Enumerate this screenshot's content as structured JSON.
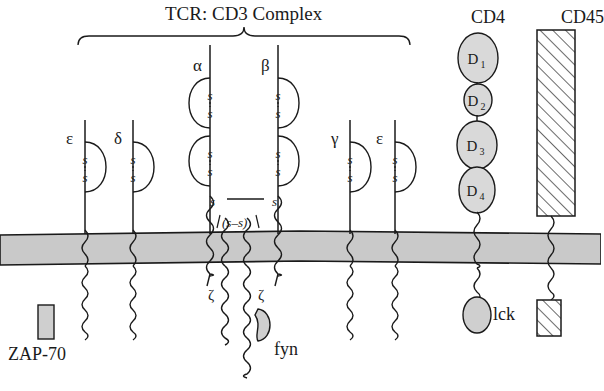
{
  "diagram": {
    "title": "TCR: CD3 Complex",
    "bracket": {
      "x1": 78,
      "x2": 410,
      "y": 36
    },
    "membrane": {
      "color": "#c9c9c9",
      "top": 232,
      "bottom": 262
    }
  },
  "complex_chains": [
    {
      "name": "epsilon",
      "label": "ε",
      "x": 85,
      "label_x": 66,
      "label_y": 130,
      "stem_top": 120,
      "loops": 1,
      "loop_side": "right",
      "ss_labels": [
        "s",
        "s"
      ]
    },
    {
      "name": "delta",
      "label": "δ",
      "x": 133,
      "label_x": 114,
      "label_y": 130,
      "stem_top": 120,
      "loops": 1,
      "loop_side": "right",
      "ss_labels": [
        "s",
        "s"
      ]
    },
    {
      "name": "alpha",
      "label": "α",
      "x": 210,
      "label_x": 193,
      "label_y": 57,
      "stem_top": 45,
      "loops": 2,
      "loop_side": "left",
      "ss_labels": [
        "s",
        "s"
      ]
    },
    {
      "name": "beta",
      "label": "β",
      "x": 278,
      "label_x": 261,
      "label_y": 57,
      "stem_top": 45,
      "loops": 2,
      "loop_side": "right",
      "ss_labels": [
        "s",
        "s"
      ]
    },
    {
      "name": "gamma",
      "label": "γ",
      "x": 350,
      "label_x": 331,
      "label_y": 130,
      "stem_top": 120,
      "loops": 1,
      "loop_side": "right",
      "ss_labels": [
        "s",
        "s"
      ]
    },
    {
      "name": "epsilon-2",
      "label": "ε",
      "x": 395,
      "label_x": 376,
      "label_y": 130,
      "stem_top": 120,
      "loops": 1,
      "loop_side": "right",
      "ss_labels": [
        "s",
        "s"
      ]
    }
  ],
  "bonds": {
    "alpha_beta": {
      "left_label": "s",
      "right_label": "s",
      "y": 203,
      "x1": 219,
      "x2": 270
    },
    "zeta_zeta": {
      "label": "(s–s)",
      "x": 238,
      "y": 224
    }
  },
  "zeta_chains": [
    {
      "label": "ζ",
      "label_x": 208,
      "label_y": 288,
      "x": 225
    },
    {
      "label": "ζ",
      "label_x": 258,
      "label_y": 288,
      "x": 247
    }
  ],
  "cd4": {
    "label": "CD4",
    "label_x": 471,
    "label_y": 8,
    "domains": [
      {
        "label": "D",
        "sub": "1",
        "cx": 478,
        "cy": 58,
        "rx": 20,
        "ry": 25
      },
      {
        "label": "D",
        "sub": "2",
        "cx": 478,
        "cy": 100,
        "rx": 14,
        "ry": 16
      },
      {
        "label": "D",
        "sub": "3",
        "cx": 477,
        "cy": 145,
        "rx": 20,
        "ry": 24
      },
      {
        "label": "D",
        "sub": "4",
        "cx": 477,
        "cy": 190,
        "rx": 18,
        "ry": 23
      }
    ],
    "fill": "#d9d9d9",
    "chain_x": 477
  },
  "cd45": {
    "label": "CD45",
    "label_x": 561,
    "label_y": 8,
    "ecto_box": {
      "x": 537,
      "y": 30,
      "w": 38,
      "h": 186
    },
    "cyto_box": {
      "x": 537,
      "y": 300,
      "w": 24,
      "h": 36
    },
    "chain_x": 551
  },
  "kinases": {
    "fyn": {
      "label": "fyn",
      "label_x": 274,
      "label_y": 340,
      "cx": 258,
      "cy": 325,
      "fill": "#cfcfcf"
    },
    "lck": {
      "label": "lck",
      "label_x": 493,
      "label_y": 305,
      "cx": 477,
      "cy": 315,
      "rx": 14,
      "ry": 18,
      "fill": "#cfcfcf"
    },
    "zap70": {
      "label": "ZAP-70",
      "label_x": 8,
      "label_y": 345,
      "box": {
        "x": 38,
        "y": 305,
        "w": 16,
        "h": 34
      },
      "fill": "#cfcfcf"
    }
  }
}
